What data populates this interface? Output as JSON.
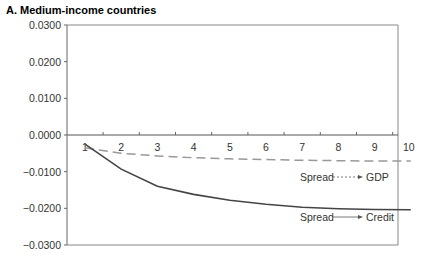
{
  "chart_data": {
    "type": "line",
    "title": "A. Medium-income  countries",
    "xlabel": "",
    "ylabel": "",
    "x": [
      1,
      2,
      3,
      4,
      5,
      6,
      7,
      8,
      9,
      10
    ],
    "ylim": [
      -0.03,
      0.03
    ],
    "yticks": [
      "0.0300",
      "0.0200",
      "0.0100",
      "0.0000",
      "−0.0100",
      "−0.0200",
      "−0.0300"
    ],
    "ytick_values": [
      0.03,
      0.02,
      0.01,
      0,
      -0.01,
      -0.02,
      -0.03
    ],
    "xticks": [
      "1",
      "2",
      "3",
      "4",
      "5",
      "6",
      "7",
      "8",
      "9",
      "10"
    ],
    "grid": false,
    "series": [
      {
        "name": "Spread → GDP",
        "style": "dashed",
        "color": "#999999",
        "values": [
          -0.0035,
          -0.005,
          -0.0057,
          -0.0062,
          -0.0065,
          -0.0067,
          -0.0069,
          -0.007,
          -0.0071,
          -0.0071
        ]
      },
      {
        "name": "Spread → Credit",
        "style": "solid",
        "color": "#444444",
        "values": [
          -0.0025,
          -0.0093,
          -0.014,
          -0.0162,
          -0.0178,
          -0.0189,
          -0.0197,
          -0.0201,
          -0.0203,
          -0.0204
        ]
      }
    ],
    "annotations": [
      {
        "text_from": "Spread",
        "text_to": "GDP",
        "series": 0
      },
      {
        "text_from": "Spread",
        "text_to": "Credit",
        "series": 1
      }
    ]
  }
}
